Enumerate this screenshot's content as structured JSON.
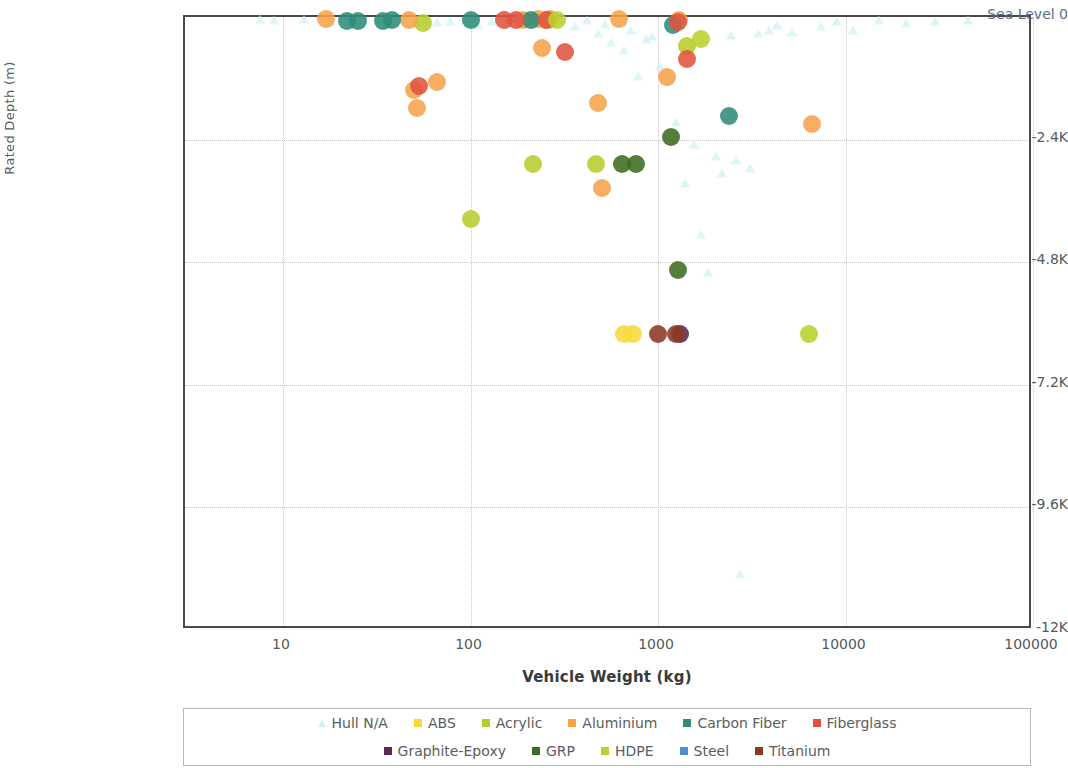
{
  "chart_data": {
    "type": "scatter",
    "title": "",
    "xlabel": "Vehicle Weight (kg)",
    "ylabel": "Rated Depth (m)",
    "xscale": "log",
    "xlim": [
      3,
      100000
    ],
    "ylim": [
      -12000,
      0
    ],
    "grid": true,
    "legend_position": "bottom",
    "x_ticks": [
      {
        "value": 10,
        "label": "10"
      },
      {
        "value": 100,
        "label": "100"
      },
      {
        "value": 1000,
        "label": "1000"
      },
      {
        "value": 10000,
        "label": "10000"
      },
      {
        "value": 100000,
        "label": "100000"
      }
    ],
    "y_ticks": [
      {
        "value": 0,
        "label": "Sea Level  0"
      },
      {
        "value": -2400,
        "label": "-2.4K"
      },
      {
        "value": -4800,
        "label": "-4.8K"
      },
      {
        "value": -7200,
        "label": "-7.2K"
      },
      {
        "value": -9600,
        "label": "-9.6K"
      },
      {
        "value": -12000,
        "label": "-12K"
      }
    ],
    "series": [
      {
        "name": "Hull N/A",
        "color": "#cdeff5",
        "marker": "triangle",
        "points": [
          [
            7.5,
            -30
          ],
          [
            9,
            -60
          ],
          [
            13,
            -40
          ],
          [
            18,
            -90
          ],
          [
            25,
            -50
          ],
          [
            33,
            -70
          ],
          [
            44,
            -60
          ],
          [
            52,
            -120
          ],
          [
            58,
            -40
          ],
          [
            66,
            -100
          ],
          [
            78,
            -80
          ],
          [
            95,
            -60
          ],
          [
            110,
            -150
          ],
          [
            130,
            -70
          ],
          [
            155,
            -110
          ],
          [
            185,
            -60
          ],
          [
            210,
            -130
          ],
          [
            250,
            -90
          ],
          [
            300,
            -70
          ],
          [
            360,
            -180
          ],
          [
            420,
            -60
          ],
          [
            480,
            -320
          ],
          [
            520,
            -130
          ],
          [
            560,
            -480
          ],
          [
            620,
            -90
          ],
          [
            660,
            -640
          ],
          [
            720,
            -260
          ],
          [
            780,
            -1150
          ],
          [
            860,
            -430
          ],
          [
            930,
            -380
          ],
          [
            1020,
            -950
          ],
          [
            1150,
            -1280
          ],
          [
            1250,
            -2050
          ],
          [
            1400,
            -3250
          ],
          [
            1550,
            -2480
          ],
          [
            1700,
            -4250
          ],
          [
            1850,
            -5000
          ],
          [
            2050,
            -2720
          ],
          [
            2200,
            -3050
          ],
          [
            2450,
            -350
          ],
          [
            2600,
            -2800
          ],
          [
            2750,
            -10900
          ],
          [
            3100,
            -2950
          ],
          [
            3400,
            -320
          ],
          [
            3900,
            -260
          ],
          [
            4300,
            -160
          ],
          [
            5200,
            -300
          ],
          [
            6200,
            -6200
          ],
          [
            7400,
            -180
          ],
          [
            9000,
            -70
          ],
          [
            11000,
            -250
          ],
          [
            15000,
            -60
          ],
          [
            21000,
            -120
          ],
          [
            30000,
            -80
          ],
          [
            45000,
            -60
          ]
        ]
      },
      {
        "name": "ABS",
        "color": "#f7d93a",
        "marker": "circle",
        "points": [
          [
            660,
            -6200
          ],
          [
            740,
            -6200
          ]
        ]
      },
      {
        "name": "Acrylic",
        "color": "#b8cc2e",
        "marker": "circle",
        "points": [
          [
            100,
            -3950
          ],
          [
            215,
            -2870
          ],
          [
            465,
            -2870
          ],
          [
            56,
            -110
          ],
          [
            250,
            -60
          ],
          [
            1420,
            -560
          ]
        ]
      },
      {
        "name": "Aluminium",
        "color": "#f7a34a",
        "marker": "circle",
        "points": [
          [
            17,
            -40
          ],
          [
            47,
            -55
          ],
          [
            50,
            -1430
          ],
          [
            52,
            -1790
          ],
          [
            66,
            -1280
          ],
          [
            190,
            -50
          ],
          [
            230,
            -40
          ],
          [
            240,
            -610
          ],
          [
            265,
            -45
          ],
          [
            480,
            -1680
          ],
          [
            505,
            -3350
          ],
          [
            620,
            -40
          ],
          [
            1120,
            -1180
          ],
          [
            1300,
            -60
          ],
          [
            6600,
            -2100
          ]
        ]
      },
      {
        "name": "Carbon Fiber",
        "color": "#2e8c79",
        "marker": "circle",
        "points": [
          [
            22,
            -75
          ],
          [
            25,
            -70
          ],
          [
            34,
            -70
          ],
          [
            38,
            -65
          ],
          [
            100,
            -65
          ],
          [
            210,
            -50
          ],
          [
            1200,
            -160
          ],
          [
            2400,
            -1930
          ]
        ]
      },
      {
        "name": "Fiberglass",
        "color": "#e0533f",
        "marker": "circle",
        "points": [
          [
            53,
            -1350
          ],
          [
            150,
            -60
          ],
          [
            175,
            -55
          ],
          [
            255,
            -60
          ],
          [
            320,
            -690
          ],
          [
            1280,
            -95
          ],
          [
            1420,
            -820
          ]
        ]
      },
      {
        "name": "Graphite-Epoxy",
        "color": "#5b2a57",
        "marker": "circle",
        "points": [
          [
            1310,
            -6200
          ]
        ]
      },
      {
        "name": "GRP",
        "color": "#3d6b21",
        "marker": "circle",
        "points": [
          [
            640,
            -2870
          ],
          [
            760,
            -2870
          ],
          [
            1180,
            -2350
          ],
          [
            1280,
            -4950
          ]
        ]
      },
      {
        "name": "HDPE",
        "color": "#b9d12c",
        "marker": "circle",
        "points": [
          [
            290,
            -55
          ],
          [
            1700,
            -440
          ],
          [
            6400,
            -6200
          ]
        ]
      },
      {
        "name": "Steel",
        "color": "#4a90d9",
        "marker": "circle",
        "points": []
      },
      {
        "name": "Titanium",
        "color": "#8b3a22",
        "marker": "circle",
        "points": [
          [
            1000,
            -6200
          ],
          [
            1250,
            -6200
          ]
        ]
      }
    ]
  },
  "legend": {
    "rows": [
      [
        "Hull N/A",
        "ABS",
        "Acrylic",
        "Aluminium",
        "Carbon Fiber",
        "Fiberglass"
      ],
      [
        "Graphite-Epoxy",
        "GRP",
        "HDPE",
        "Steel",
        "Titanium"
      ]
    ]
  }
}
